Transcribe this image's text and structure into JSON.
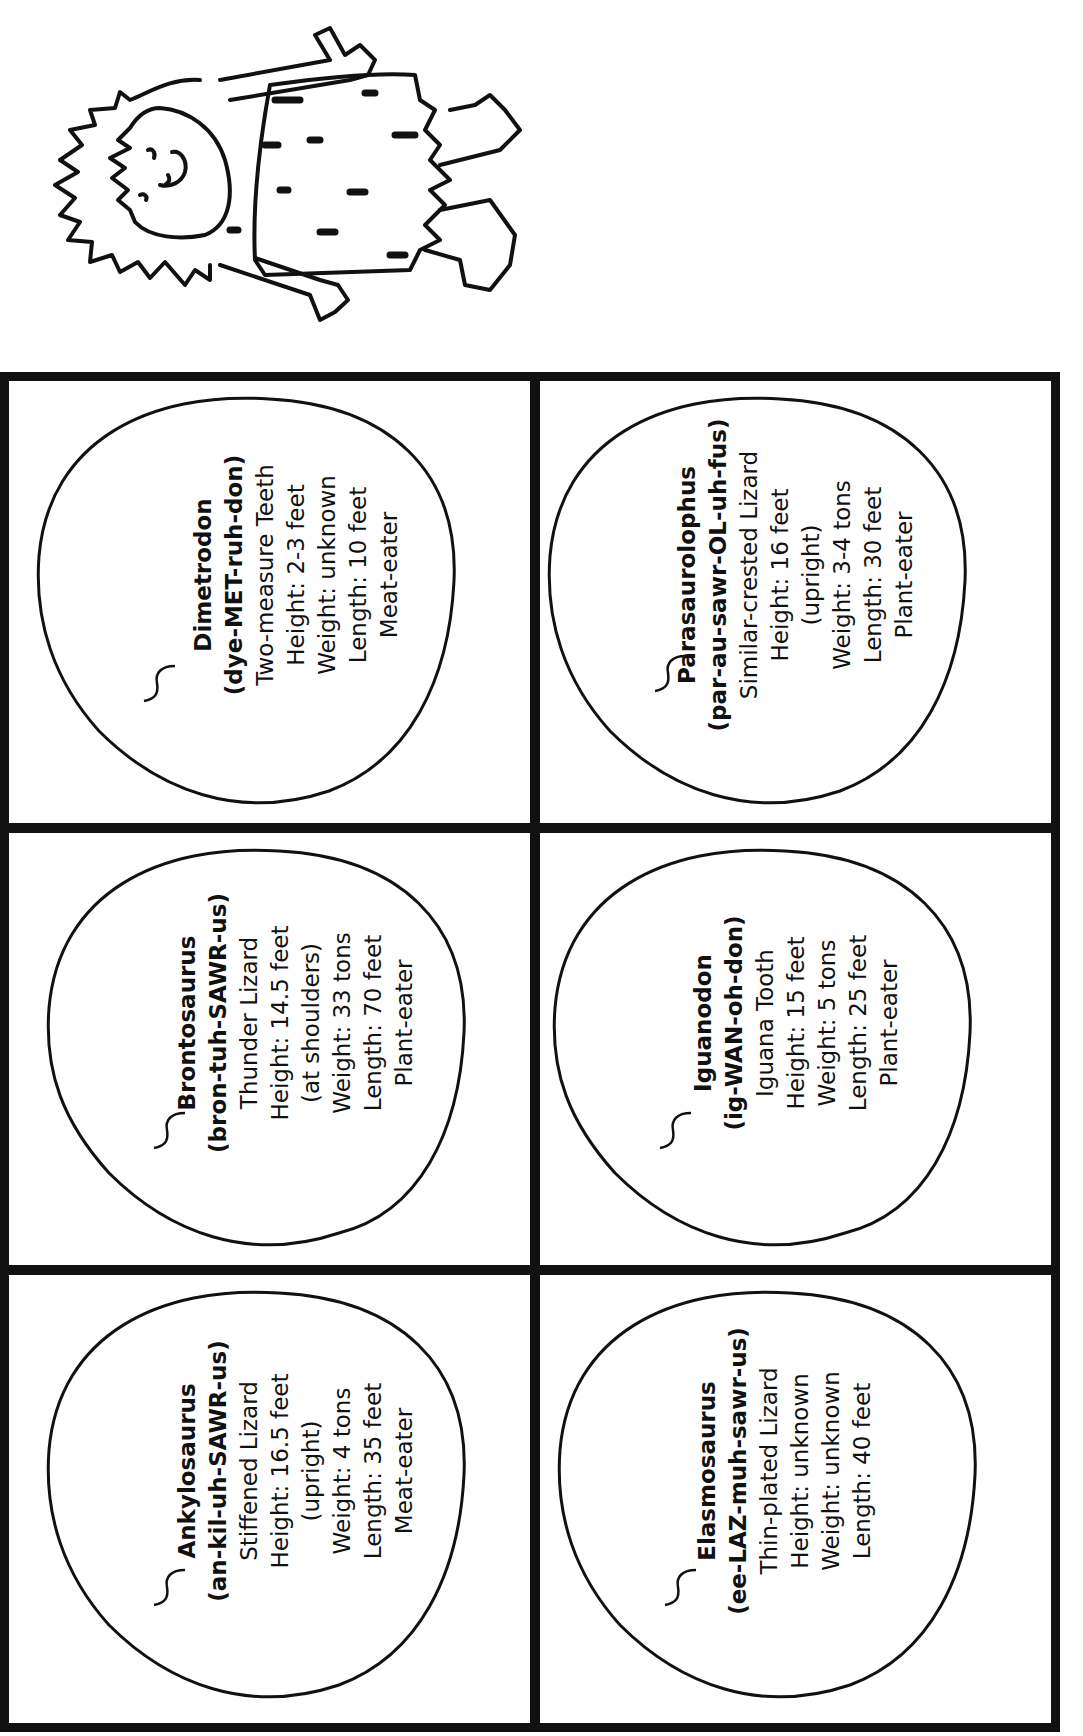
{
  "page": {
    "orientation": "rotated-90-ccw",
    "illustration": "caveman-icon"
  },
  "cards": [
    {
      "name": "Dimetrodon",
      "pronunciation": "(dye-MET-ruh-don)",
      "meaning": "Two-measure Teeth",
      "lines": [
        "Height: 2-3 feet",
        "Weight: unknown",
        "Length: 10 feet",
        "Meat-eater"
      ]
    },
    {
      "name": "Parasaurolophus",
      "pronunciation": "(par-au-sawr-OL-uh-fus)",
      "meaning": "Similar-crested Lizard",
      "lines": [
        "Height: 16 feet",
        "(upright)",
        "Weight: 3-4 tons",
        "Length: 30 feet",
        "Plant-eater"
      ]
    },
    {
      "name": "Brontosaurus",
      "pronunciation": "(bron-tuh-SAWR-us)",
      "meaning": "Thunder Lizard",
      "lines": [
        "Height: 14.5 feet",
        "(at shoulders)",
        "Weight: 33 tons",
        "Length: 70 feet",
        "Plant-eater"
      ]
    },
    {
      "name": "Iguanodon",
      "pronunciation": "(ig-WAN-oh-don)",
      "meaning": "Iguana Tooth",
      "lines": [
        "Height: 15 feet",
        "Weight: 5 tons",
        "Length: 25 feet",
        "Plant-eater"
      ]
    },
    {
      "name": "Ankylosaurus",
      "pronunciation": "(an-kil-uh-SAWR-us)",
      "meaning": "Stiffened Lizard",
      "lines": [
        "Height: 16.5 feet",
        "(upright)",
        "Weight: 4 tons",
        "Length: 35 feet",
        "Meat-eater"
      ]
    },
    {
      "name": "Elasmosaurus",
      "pronunciation": "(ee-LAZ-muh-sawr-us)",
      "meaning": "Thin-plated Lizard",
      "lines": [
        "Height: unknown",
        "Weight: unknown",
        "Length: 40 feet"
      ]
    }
  ]
}
